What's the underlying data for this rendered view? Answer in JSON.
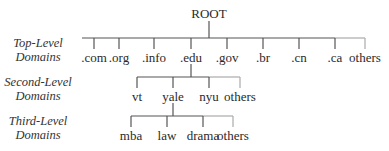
{
  "root": {
    "label": "ROOT"
  },
  "levels": [
    {
      "line1": "Top-Level",
      "line2": "Domains"
    },
    {
      "line1": "Second-Level",
      "line2": "Domains"
    },
    {
      "line1": "Third-Level",
      "line2": "Domains"
    }
  ],
  "top_level": [
    ".com",
    ".org",
    ".info",
    ".edu",
    ".gov",
    ".br",
    ".cn",
    ".ca",
    "others"
  ],
  "second_level": {
    "parent": ".edu",
    "items": [
      "vt",
      "yale",
      "nyu",
      "others"
    ]
  },
  "third_level": {
    "parent": "yale",
    "items": [
      "mba",
      "law",
      "drama",
      "others"
    ]
  },
  "colors": {
    "line": "#555555",
    "others_line": "#aaaaaa",
    "text": "#2a2a2a"
  }
}
